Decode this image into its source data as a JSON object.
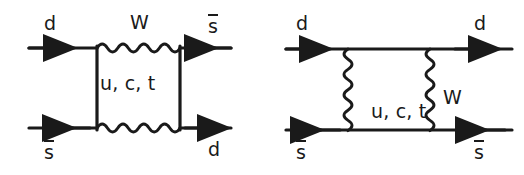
{
  "figure": {
    "background_color": "#ffffff",
    "line_color": "#1a1a1a",
    "width": 524,
    "height": 175
  },
  "diagrams": [
    {
      "id": "left",
      "name": "horizontal-w-box-diagram",
      "description": "Box diagram with horizontal W boson propagators and vertical quark lines",
      "labels": {
        "top_left": "d",
        "top_center": "W",
        "top_right": "s",
        "top_right_bar": true,
        "internal": "u, c, t",
        "bottom_left": "s",
        "bottom_left_bar": true,
        "bottom_right": "d"
      },
      "fermion_lines": [
        {
          "name": "incoming-d-top",
          "label": "d",
          "arrow": "right",
          "y": 48
        },
        {
          "name": "outgoing-sbar-top",
          "label": "s-bar",
          "arrow": "left",
          "y": 48
        },
        {
          "name": "incoming-sbar-bottom",
          "label": "s-bar",
          "arrow": "left",
          "y": 128
        },
        {
          "name": "outgoing-d-bottom",
          "label": "d",
          "arrow": "right",
          "y": 128
        }
      ],
      "boson_lines": [
        {
          "name": "w-boson-top",
          "label": "W",
          "orientation": "horizontal",
          "y": 48
        },
        {
          "name": "w-boson-bottom",
          "label": "W",
          "orientation": "horizontal",
          "y": 128
        }
      ],
      "internal_quark_lines": [
        {
          "name": "quark-line-left",
          "label": "u, c, t",
          "x": 97
        },
        {
          "name": "quark-line-right",
          "label": "u, c, t",
          "x": 180
        }
      ]
    },
    {
      "id": "right",
      "name": "vertical-w-box-diagram",
      "description": "Box diagram with vertical W boson propagators and horizontal quark lines",
      "labels": {
        "top_left": "d",
        "top_right": "d",
        "internal": "u, c, t",
        "boson": "W",
        "bottom_left": "s",
        "bottom_left_bar": true,
        "bottom_right": "s",
        "bottom_right_bar": true
      },
      "fermion_lines": [
        {
          "name": "incoming-d-top",
          "label": "d",
          "arrow": "right",
          "y": 49
        },
        {
          "name": "outgoing-d-top",
          "label": "d",
          "arrow": "right",
          "y": 49
        },
        {
          "name": "sbar-bottom-left",
          "label": "s-bar",
          "arrow": "left",
          "y": 130
        },
        {
          "name": "sbar-bottom-right",
          "label": "s-bar",
          "arrow": "left",
          "y": 130
        }
      ],
      "boson_lines": [
        {
          "name": "w-boson-left",
          "label": "W",
          "orientation": "vertical",
          "x": 348
        },
        {
          "name": "w-boson-right",
          "label": "W",
          "orientation": "vertical",
          "x": 430
        }
      ],
      "internal_quark_lines": [
        {
          "name": "quark-line-internal",
          "label": "u, c, t",
          "y": 130
        }
      ]
    }
  ]
}
